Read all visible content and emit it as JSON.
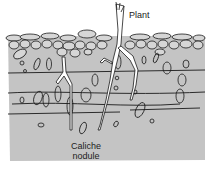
{
  "diagram": {
    "labels": {
      "plant": "Plant",
      "caliche_line1": "Caliche",
      "caliche_line2": "nodule"
    },
    "colors": {
      "soil": "#c4c4c4",
      "outline": "#1a1a1a",
      "root": "#ffffff",
      "background": "#ffffff"
    }
  }
}
